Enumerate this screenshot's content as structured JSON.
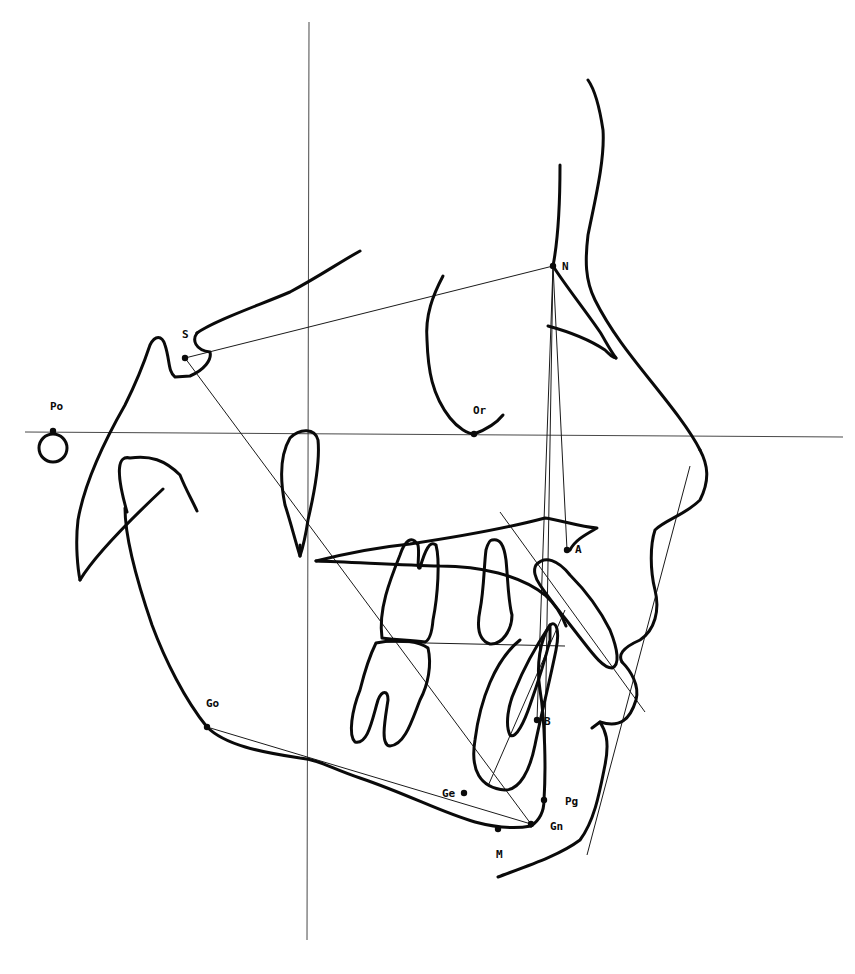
{
  "diagram": {
    "type": "cephalometric-tracing",
    "colors": {
      "ink": "#0a0a0a",
      "background": "#ffffff"
    }
  },
  "landmarks": [
    {
      "id": "S",
      "label": "S",
      "x": 185,
      "y": 358,
      "lx": 182,
      "ly": 338
    },
    {
      "id": "N",
      "label": "N",
      "x": 553,
      "y": 266,
      "lx": 562,
      "ly": 270
    },
    {
      "id": "Po",
      "label": "Po",
      "x": 53,
      "y": 431,
      "lx": 50,
      "ly": 410
    },
    {
      "id": "Or",
      "label": "Or",
      "x": 474,
      "y": 434,
      "lx": 473,
      "ly": 414
    },
    {
      "id": "A",
      "label": "A",
      "x": 567,
      "y": 550,
      "lx": 575,
      "ly": 553
    },
    {
      "id": "B",
      "label": "B",
      "x": 537,
      "y": 720,
      "lx": 544,
      "ly": 725
    },
    {
      "id": "Go",
      "label": "Go",
      "x": 207,
      "y": 727,
      "lx": 206,
      "ly": 707
    },
    {
      "id": "Gn",
      "label": "Gn",
      "x": 531,
      "y": 824,
      "lx": 550,
      "ly": 830
    },
    {
      "id": "Pg",
      "label": "Pg",
      "x": 544,
      "y": 800,
      "lx": 565,
      "ly": 805
    },
    {
      "id": "M",
      "label": "M",
      "x": 498,
      "y": 829,
      "lx": 496,
      "ly": 858
    },
    {
      "id": "Ge",
      "label": "Ge",
      "x": 464,
      "y": 793,
      "lx": 442,
      "ly": 797
    }
  ],
  "reference_lines": {
    "frankfort_horizontal": {
      "x1": 25,
      "y1": 432,
      "x2": 843,
      "y2": 437
    },
    "vertical": {
      "x1": 309,
      "y1": 22,
      "x2": 307,
      "y2": 940
    }
  },
  "construction_lines": [
    {
      "name": "S-N",
      "x1": 185,
      "y1": 358,
      "x2": 553,
      "y2": 266
    },
    {
      "name": "S-Gn",
      "x1": 185,
      "y1": 358,
      "x2": 531,
      "y2": 824
    },
    {
      "name": "Go-Gn",
      "x1": 207,
      "y1": 727,
      "x2": 531,
      "y2": 824
    },
    {
      "name": "N-A",
      "x1": 553,
      "y1": 266,
      "x2": 567,
      "y2": 550
    },
    {
      "name": "N-B",
      "x1": 553,
      "y1": 266,
      "x2": 537,
      "y2": 720
    },
    {
      "name": "N-Pg",
      "x1": 553,
      "y1": 266,
      "x2": 544,
      "y2": 800
    },
    {
      "name": "occlusal-plane",
      "x1": 380,
      "y1": 642,
      "x2": 565,
      "y2": 646
    },
    {
      "name": "upper-incisor-axis",
      "x1": 500,
      "y1": 512,
      "x2": 645,
      "y2": 712
    },
    {
      "name": "lower-incisor-axis",
      "x1": 488,
      "y1": 786,
      "x2": 565,
      "y2": 610
    },
    {
      "name": "E-line",
      "x1": 690,
      "y1": 466,
      "x2": 587,
      "y2": 855
    }
  ],
  "tracings": {
    "sella_planum": "M197,333 C215,320 260,305 290,292 C320,276 340,262 360,251",
    "sella_turcica": "M197,333 C192,340 195,350 210,352 C212,360 204,370 190,376 L175,377 C168,372 170,360 165,345 C162,335 155,335 150,345 C145,360 135,385 125,405 C105,440 85,480 78,520 C75,545 78,570 80,580",
    "ramus_back": "M80,580 C95,555 130,520 163,489",
    "condyle": "M127,512 C115,470 118,455 130,458 C150,455 165,460 180,475 C186,490 192,500 197,511",
    "ramus_posterior": "M125,508 C125,540 140,590 152,625 C165,660 185,700 207,727",
    "mandible_lower": "M207,727 C225,745 260,752 300,758 C320,760 330,768 360,778 C410,795 440,812 475,822 C490,826 510,830 531,826",
    "symphysis": "M531,826 C540,820 544,810 544,800 C546,770 545,720 540,690 C536,665 540,640 550,625 C556,620 560,630 556,650 C550,680 540,720 535,745 C530,770 520,790 505,790 C480,788 470,770 475,740 C480,700 495,660 520,640",
    "chin_soft": "M498,877 C530,865 560,855 580,840 C595,820 600,790 605,765 C610,740 605,730 600,722 L592,728",
    "lower_lip": "M600,722 C620,728 630,720 636,700 C640,685 630,670 622,662",
    "upper_lip": "M622,662 C618,655 622,648 640,640 C655,630 660,610 655,590 C650,570 650,545 655,530 C665,520 685,515 700,500 C710,480 708,465 700,450",
    "nose_profile": "M700,450 C690,430 670,405 650,380 C630,355 610,330 595,300 C585,280 585,260 588,235 C595,200 605,160 603,130 C600,110 595,90 588,80",
    "nasal_bone": "M553,266 C558,240 560,200 560,165",
    "nasal_bone_lower": "M553,266 C565,285 585,310 600,332 C605,340 610,350 616,358",
    "nasal_tip_inner": "M548,326 C570,332 590,340 605,350 C610,355 613,358 616,358",
    "orbit": "M443,276 C433,295 425,315 427,340 C428,370 432,395 450,418 C458,428 468,434 474,434 C485,430 495,425 503,415",
    "pterygomaxillary": "M300,556 C295,540 290,520 285,505 C280,480 280,455 290,438 C300,428 315,428 318,440 C320,460 315,490 308,520 C305,540 302,550 300,556",
    "palatal_upper": "M316,561 C340,555 380,547 410,544 C450,538 500,530 545,518 C560,520 580,527 597,528 C585,535 575,540 570,550",
    "palatal_lower": "M316,561 C350,562 400,565 440,566 C480,566 520,575 545,595 C556,605 562,615 566,626",
    "upper_molar": "M382,638 C378,610 390,580 400,555 C405,540 412,535 418,545 C420,555 416,570 420,568 C425,550 430,540 436,545 C440,560 438,595 433,620 C432,632 430,640 425,642 C410,640 395,640 382,638",
    "lower_molar": "M376,643 C400,638 420,642 428,648 C432,665 428,685 420,700 C412,720 405,745 390,746 C380,745 385,720 388,700 C388,690 382,690 378,700 C372,720 368,745 355,742 C348,735 352,710 360,690 C365,670 370,655 376,643",
    "premolar": "M492,540 C500,538 504,545 506,560 C508,580 508,600 512,615 C512,630 502,645 490,644 C478,640 477,625 480,610 C484,590 484,565 486,550 C488,543 490,540 492,540",
    "upper_incisor": "M536,565 C545,555 558,560 570,575 C585,590 600,610 610,630 C618,650 620,665 612,668 C602,668 590,650 578,635 C565,618 550,600 540,585 C535,578 533,570 536,565",
    "lower_incisor": "M550,625 C540,640 525,665 515,690 C508,705 505,725 510,735 C516,740 525,720 530,705 C536,688 545,660 550,640 Z",
    "pg_dot": "M544,800 L544,800",
    "posterior_ramus_inner": "M300,556 C300,552 300,548 300,545"
  },
  "porion_circle": {
    "cx": 53,
    "cy": 448,
    "r": 14
  }
}
